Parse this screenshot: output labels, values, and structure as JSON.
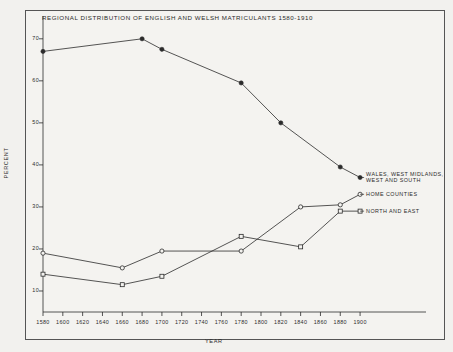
{
  "chart_data": {
    "type": "line",
    "title": "REGIONAL DISTRIBUTION OF ENGLISH AND WELSH MATRICULANTS 1580-1910",
    "xlabel": "YEAR",
    "ylabel": "PERCENT",
    "xlim": [
      1580,
      1910
    ],
    "ylim": [
      5,
      74
    ],
    "grid": false,
    "legend_position": "right-inline-labels",
    "xticks": [
      1580,
      1600,
      1620,
      1640,
      1660,
      1680,
      1700,
      1720,
      1740,
      1760,
      1780,
      1800,
      1820,
      1840,
      1860,
      1880,
      1900
    ],
    "yticks": [
      10,
      20,
      30,
      40,
      50,
      60,
      70
    ],
    "series": [
      {
        "name": "WALES, WEST MIDLANDS, WEST AND SOUTH",
        "marker": "filled-circle",
        "x": [
          1580,
          1680,
          1700,
          1780,
          1820,
          1880,
          1900
        ],
        "values": [
          67,
          70,
          67.5,
          59.5,
          50,
          39.5,
          37
        ]
      },
      {
        "name": "HOME COUNTIES",
        "marker": "open-circle",
        "x": [
          1580,
          1660,
          1700,
          1780,
          1840,
          1880,
          1900
        ],
        "values": [
          19,
          15.5,
          19.5,
          19.5,
          30,
          30.5,
          33
        ]
      },
      {
        "name": "NORTH AND EAST",
        "marker": "open-square",
        "x": [
          1580,
          1660,
          1700,
          1780,
          1840,
          1880,
          1900
        ],
        "values": [
          14,
          11.5,
          13.5,
          23,
          20.5,
          29,
          29
        ]
      }
    ]
  },
  "labels": {
    "series1": {
      "line1": "WALES, WEST MIDLANDS,",
      "line2": "WEST AND SOUTH"
    },
    "series2": "HOME COUNTIES",
    "series3": "NORTH AND EAST"
  },
  "colors": {
    "ink": "#2b2b2b",
    "paper": "#f4f3f0",
    "frame": "#555555"
  }
}
